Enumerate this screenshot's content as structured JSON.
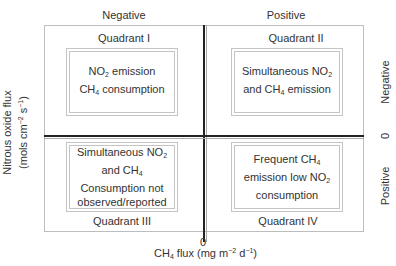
{
  "diagram": {
    "top_labels": {
      "left": "Negative",
      "right": "Positive"
    },
    "right_labels": {
      "top": "Negative",
      "zero": "0",
      "bottom": "Positive"
    },
    "x_axis": {
      "zero": "0",
      "label_prefix": "CH",
      "label_sub": "4",
      "label_rest": " flux (mg m",
      "label_sup1": "−2",
      "label_mid": " d",
      "label_sup2": "−1",
      "label_end": ")"
    },
    "y_axis": {
      "line1": "Nitrous oxide flux",
      "line2_prefix": "(mols cm",
      "line2_sup1": "−2",
      "line2_mid": " s",
      "line2_sup2": "−1",
      "line2_end": ")"
    },
    "quadrants": [
      {
        "id": "I",
        "label": "Quadrant I",
        "lines": [
          {
            "a": "NO",
            "sub": "2",
            "b": " emission"
          },
          {
            "a": "CH",
            "sub": "4",
            "b": " consumption"
          }
        ]
      },
      {
        "id": "II",
        "label": "Quadrant II",
        "lines": [
          {
            "a": "Simultaneous NO",
            "sub": "2",
            "b": ""
          },
          {
            "a": "and CH",
            "sub": "4",
            "b": " emission"
          }
        ]
      },
      {
        "id": "III",
        "label": "Quadrant III",
        "lines": [
          {
            "a": "Simultaneous NO",
            "sub": "2",
            "b": ""
          },
          {
            "a": "and CH",
            "sub": "4",
            "b": ""
          },
          {
            "a": "Consumption not",
            "sub": "",
            "b": ""
          },
          {
            "a": "observed/reported",
            "sub": "",
            "b": ""
          }
        ]
      },
      {
        "id": "IV",
        "label": "Quadrant IV",
        "lines": [
          {
            "a": "Frequent CH",
            "sub": "4",
            "b": ""
          },
          {
            "a": "emission low NO",
            "sub": "2",
            "b": ""
          },
          {
            "a": "consumption",
            "sub": "",
            "b": ""
          }
        ]
      }
    ]
  }
}
